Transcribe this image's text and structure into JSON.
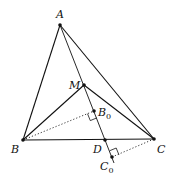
{
  "figure": {
    "points": {
      "A": {
        "label": "A",
        "x": 60,
        "y": 25
      },
      "B": {
        "label": "B",
        "x": 23,
        "y": 140
      },
      "C": {
        "label": "C",
        "x": 154,
        "y": 139
      },
      "M": {
        "label": "M",
        "x": 84,
        "y": 85
      },
      "B0": {
        "label": "B",
        "sub": "0",
        "x": 94,
        "y": 111
      },
      "D": {
        "label": "D",
        "x": 105,
        "y": 140
      },
      "C0": {
        "label": "C",
        "sub": "0",
        "x": 112,
        "y": 157
      }
    },
    "segments_solid": [
      "AB",
      "AC",
      "BC",
      "MB",
      "MC",
      "A-C0 (line through M, B0, D)"
    ],
    "segments_dotted": [
      "B-B0",
      "C-C0"
    ],
    "right_angles": [
      "B0",
      "C0"
    ]
  }
}
